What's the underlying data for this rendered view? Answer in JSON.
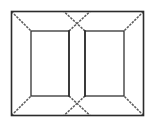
{
  "diagram": {
    "canvas": {
      "width": 154,
      "height": 127,
      "background": "#ffffff"
    },
    "colors": {
      "solid_line": "#2b2b2b",
      "thin_line": "#333333",
      "diagonal_line": "#5a5a5a",
      "diagonal_faint": "#8d8d8d",
      "fill": "#ffffff"
    },
    "geometry": {
      "outer_frame": {
        "left": 11,
        "top": 11,
        "right": 144,
        "bottom": 116
      },
      "inner_back_wall": {
        "left": 31,
        "top": 31,
        "right": 124,
        "bottom": 96
      },
      "center_wall_left_x": 69,
      "center_wall_right_x": 85,
      "center_top_vertex_y": 20,
      "center_bottom_vertex_y": 108,
      "center_wall_top_y": 31,
      "center_wall_bottom_y": 96
    },
    "elements": [
      {
        "name": "outer-frame",
        "kind": "rectangle",
        "style": "solid"
      },
      {
        "name": "inner-back-wall-left",
        "kind": "rectangle",
        "style": "solid"
      },
      {
        "name": "inner-back-wall-right",
        "kind": "rectangle",
        "style": "solid"
      },
      {
        "name": "corner-diagonal-top-left",
        "kind": "line",
        "style": "dashed"
      },
      {
        "name": "corner-diagonal-top-right",
        "kind": "line",
        "style": "dashed"
      },
      {
        "name": "corner-diagonal-bottom-left",
        "kind": "line",
        "style": "dashed"
      },
      {
        "name": "corner-diagonal-bottom-right",
        "kind": "line",
        "style": "dashed"
      },
      {
        "name": "center-cross-top",
        "kind": "x-crossing",
        "style": "dashed"
      },
      {
        "name": "center-cross-bottom",
        "kind": "x-crossing",
        "style": "dashed"
      },
      {
        "name": "center-partition-left-edge",
        "kind": "line",
        "style": "solid"
      },
      {
        "name": "center-partition-right-edge",
        "kind": "line",
        "style": "solid"
      }
    ]
  }
}
